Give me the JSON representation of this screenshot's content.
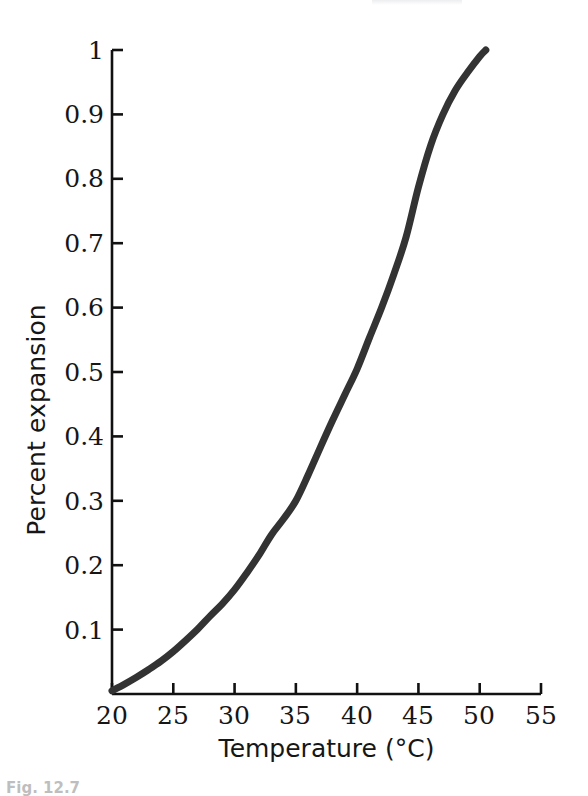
{
  "figure": {
    "background_color": "#ffffff",
    "line_color": "#333333",
    "axis_color": "#111111",
    "text_color": "#161616"
  },
  "chart_data": {
    "type": "line",
    "title": "",
    "subtitle": "",
    "xlabel": "Temperature (°C)",
    "ylabel": "Percent expansion",
    "xlim": [
      20,
      55
    ],
    "ylim": [
      0,
      1
    ],
    "grid": false,
    "legend": null,
    "legend_position": "none",
    "xticks": [
      20,
      25,
      30,
      35,
      40,
      45,
      50,
      55
    ],
    "xtick_labels": [
      "20",
      "25",
      "30",
      "35",
      "40",
      "45",
      "50",
      "55"
    ],
    "yticks": [
      0.1,
      0.2,
      0.3,
      0.4,
      0.5,
      0.6,
      0.7,
      0.8,
      0.9,
      1
    ],
    "ytick_labels": [
      "0.1",
      "0.2",
      "0.3",
      "0.4",
      "0.5",
      "0.6",
      "0.7",
      "0.8",
      "0.9",
      "1"
    ],
    "tick_direction": "in",
    "spines": [
      "left",
      "bottom"
    ],
    "series": [
      {
        "name": "Percent expansion",
        "color": "#333333",
        "line_width": 7,
        "x": [
          20,
          21,
          22,
          23,
          24,
          25,
          26,
          27,
          28,
          29,
          30,
          31,
          32,
          33,
          34,
          35,
          36,
          37,
          38,
          39,
          40,
          41,
          42,
          43,
          44,
          45,
          46,
          47,
          48,
          49,
          50,
          50.5
        ],
        "values": [
          0.005,
          0.015,
          0.026,
          0.038,
          0.051,
          0.066,
          0.083,
          0.101,
          0.121,
          0.14,
          0.162,
          0.188,
          0.216,
          0.247,
          0.272,
          0.3,
          0.34,
          0.383,
          0.425,
          0.465,
          0.505,
          0.553,
          0.6,
          0.652,
          0.71,
          0.787,
          0.852,
          0.9,
          0.937,
          0.965,
          0.99,
          1.0
        ]
      }
    ],
    "annotations": []
  },
  "caption": {
    "partial_text": "Fig. 12.7"
  }
}
